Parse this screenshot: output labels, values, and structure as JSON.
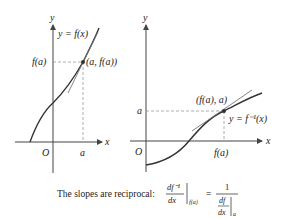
{
  "left_graph": {
    "axis_y_label": "y",
    "axis_x_label": "x",
    "origin_label": "O",
    "curve_label": "y = f(x)",
    "y_tick_label": "f(a)",
    "x_tick_label": "a",
    "point_label": "(a, f(a))"
  },
  "right_graph": {
    "axis_y_label": "y",
    "axis_x_label": "x",
    "origin_label": "O",
    "curve_label": "y = f⁻¹(x)",
    "y_tick_label": "a",
    "x_tick_label": "f(a)",
    "point_label": "(f(a), a)"
  },
  "caption": {
    "text": "The slopes are reciprocal:",
    "lhs_num": "df⁻¹",
    "lhs_den": "dx",
    "lhs_eval": "f(a)",
    "equals": "=",
    "rhs_num": "1",
    "rhs_inner_num": "df",
    "rhs_inner_den": "dx",
    "rhs_eval": "a"
  },
  "colors": {
    "curve": "#333333",
    "tangent": "#777777",
    "axis": "#444444",
    "dashed": "#999999"
  }
}
